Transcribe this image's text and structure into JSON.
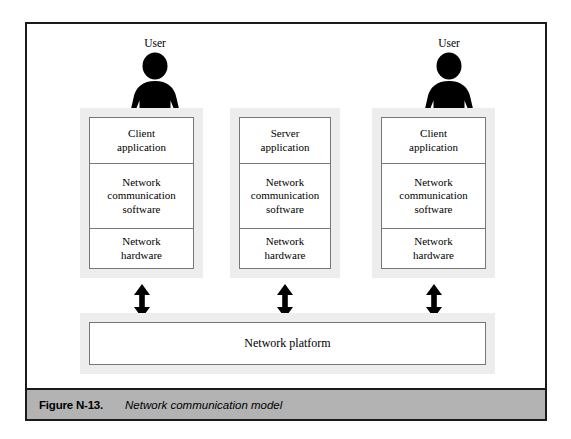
{
  "figure": {
    "caption_number": "Figure N-13.",
    "caption_text": "Network communication model",
    "frame_border_color": "#1a1a1a",
    "caption_bar_color": "#b3b3b3",
    "shadow_color": "#ededed",
    "box_border_color": "#777777"
  },
  "users": [
    {
      "label": "User",
      "icon": "user-person-icon"
    },
    {
      "label": "User",
      "icon": "user-person-icon"
    }
  ],
  "columns": [
    {
      "name": "client-left",
      "cells": [
        "Client\napplication",
        "Network\ncommunication\nsoftware",
        "Network\nhardware"
      ],
      "cell_app_line1": "Client",
      "cell_app_line2": "application",
      "cell_comm_line1": "Network",
      "cell_comm_line2": "communication",
      "cell_comm_line3": "software",
      "cell_hw_line1": "Network",
      "cell_hw_line2": "hardware"
    },
    {
      "name": "server-middle",
      "cells": [
        "Server\napplication",
        "Network\ncommunication\nsoftware",
        "Network\nhardware"
      ],
      "cell_app_line1": "Server",
      "cell_app_line2": "application",
      "cell_comm_line1": "Network",
      "cell_comm_line2": "communication",
      "cell_comm_line3": "software",
      "cell_hw_line1": "Network",
      "cell_hw_line2": "hardware"
    },
    {
      "name": "client-right",
      "cells": [
        "Client\napplication",
        "Network\ncommunication\nsoftware",
        "Network\nhardware"
      ],
      "cell_app_line1": "Client",
      "cell_app_line2": "application",
      "cell_comm_line1": "Network",
      "cell_comm_line2": "communication",
      "cell_comm_line3": "software",
      "cell_hw_line1": "Network",
      "cell_hw_line2": "hardware"
    }
  ],
  "arrows": [
    {
      "name": "arrow-left",
      "kind": "double-headed-vertical-arrow-icon"
    },
    {
      "name": "arrow-middle",
      "kind": "double-headed-vertical-arrow-icon"
    },
    {
      "name": "arrow-right",
      "kind": "double-headed-vertical-arrow-icon"
    }
  ],
  "platform": {
    "label": "Network platform"
  }
}
